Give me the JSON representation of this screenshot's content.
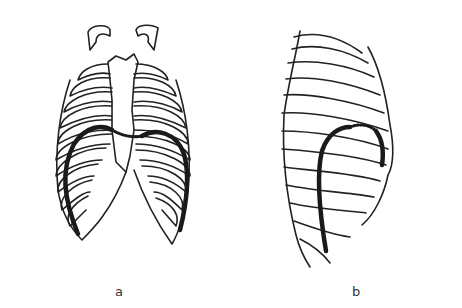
{
  "figure": {
    "panels": [
      {
        "id": "a",
        "label": "a",
        "description": "Rib cage, anterior view, with diaphragm outline"
      },
      {
        "id": "b",
        "label": "b",
        "description": "Rib cage, lateral view, with diaphragm outline"
      }
    ],
    "colors": {
      "line": "#222222",
      "diaphragm": "#1a1a1a",
      "background": "#ffffff"
    }
  }
}
